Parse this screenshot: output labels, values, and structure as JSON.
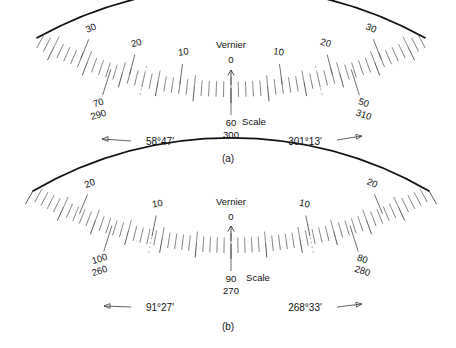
{
  "figure": {
    "caption_a": "(a)",
    "caption_b": "(b)"
  },
  "labels": {
    "vernier": "Vernier",
    "scale": "Scale",
    "zero": "0"
  },
  "colors": {
    "arc": "#111111",
    "tick": "#555555",
    "dotted_tick": "#9aa89a",
    "text": "#111111"
  },
  "chart_data": {
    "type": "diagram",
    "subplots": [
      {
        "id": "a",
        "caption": "(a)",
        "index_label": "0",
        "vernier_label": "Vernier",
        "scale_label": "Scale",
        "vernier_ticks": [
          {
            "label": "30",
            "side": "left"
          },
          {
            "label": "20",
            "side": "left"
          },
          {
            "label": "10",
            "side": "left"
          },
          {
            "label": "0",
            "side": "center"
          },
          {
            "label": "10",
            "side": "right"
          },
          {
            "label": "20",
            "side": "right"
          },
          {
            "label": "30",
            "side": "right"
          }
        ],
        "scale_ticks": [
          {
            "upper": "70",
            "lower": "290",
            "side": "left"
          },
          {
            "upper": "60",
            "lower": "300",
            "side": "center"
          },
          {
            "upper": "50",
            "lower": "310",
            "side": "right"
          }
        ],
        "readings": [
          {
            "value": "58°47′",
            "direction": "left"
          },
          {
            "value": "301°13′",
            "direction": "right"
          }
        ]
      },
      {
        "id": "b",
        "caption": "(b)",
        "index_label": "0",
        "vernier_label": "Vernier",
        "scale_label": "Scale",
        "vernier_ticks": [
          {
            "label": "20",
            "side": "left"
          },
          {
            "label": "10",
            "side": "left"
          },
          {
            "label": "0",
            "side": "center"
          },
          {
            "label": "10",
            "side": "right"
          },
          {
            "label": "20",
            "side": "right"
          }
        ],
        "scale_ticks": [
          {
            "upper": "100",
            "lower": "260",
            "side": "left"
          },
          {
            "upper": "90",
            "lower": "270",
            "side": "center"
          },
          {
            "upper": "80",
            "lower": "280",
            "side": "right"
          }
        ],
        "readings": [
          {
            "value": "91°27′",
            "direction": "left"
          },
          {
            "value": "268°33′",
            "direction": "right"
          }
        ]
      }
    ]
  }
}
